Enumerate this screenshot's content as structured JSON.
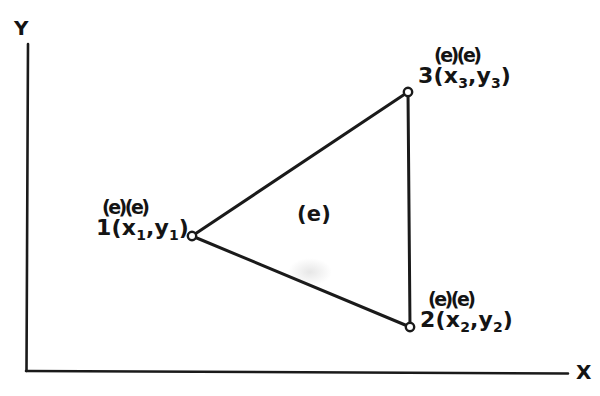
{
  "figure": {
    "background_color": "#ffffff",
    "ink_color": "#141414"
  },
  "axes": {
    "y_label": "Y",
    "x_label": "X",
    "origin": {
      "x": 26,
      "y": 371
    },
    "y_top": {
      "x": 28,
      "y": 44
    },
    "x_right": {
      "x": 568,
      "y": 373
    }
  },
  "element": {
    "interior_label": "(e)",
    "interior_label_position": {
      "x": 297,
      "y": 204
    }
  },
  "nodes": [
    {
      "id": "1",
      "number": "1",
      "superscript_markers": "(e)(e)",
      "coordinate_prefix": "1(x",
      "x_sub": "1",
      "comma": ",y",
      "y_sub": "1",
      "suffix": ")",
      "marker": {
        "x": 192,
        "y": 236
      }
    },
    {
      "id": "2",
      "number": "2",
      "superscript_markers": "(e)(e)",
      "coordinate_prefix": "2(x",
      "x_sub": "2",
      "comma": ",y",
      "y_sub": "2",
      "suffix": ")",
      "marker": {
        "x": 410,
        "y": 327
      }
    },
    {
      "id": "3",
      "number": "3",
      "superscript_markers": "(e)(e)",
      "coordinate_prefix": "3(x",
      "x_sub": "3",
      "comma": ",y",
      "y_sub": "3",
      "suffix": ")",
      "marker": {
        "x": 408,
        "y": 92
      }
    }
  ],
  "edges": [
    {
      "from": "1",
      "to": "3"
    },
    {
      "from": "3",
      "to": "2"
    },
    {
      "from": "2",
      "to": "1"
    }
  ]
}
